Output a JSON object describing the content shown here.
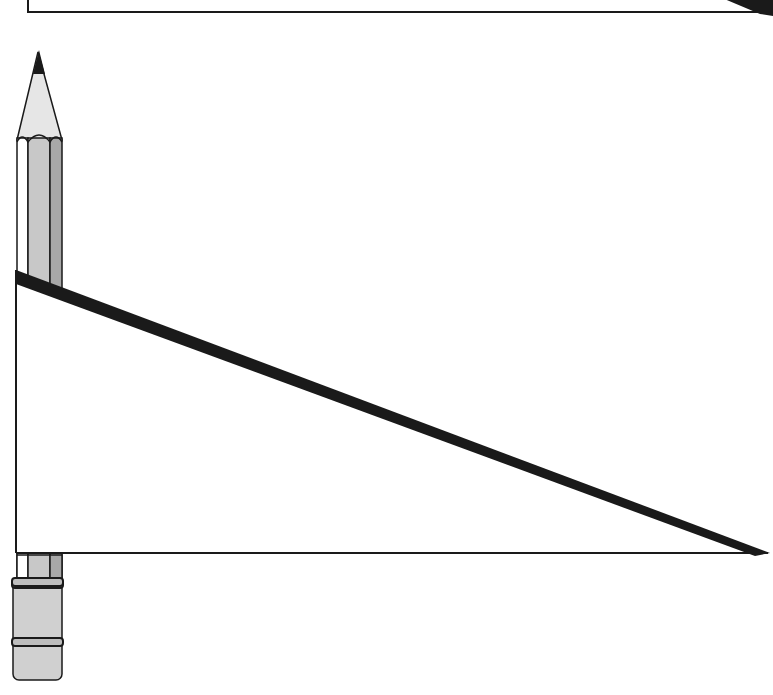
{
  "figure": {
    "colors": {
      "background": "#ffffff",
      "outline": "#1a1a1a",
      "pencil_body_light": "#ffffff",
      "pencil_body_mid": "#c8c8c8",
      "pencil_body_dark": "#a8a8a8",
      "pencil_tip_wood": "#e6e6e6",
      "pencil_lead": "#1a1a1a",
      "eraser_band": "#bdbdbd",
      "eraser": "#d0d0d0"
    },
    "top_triangle": {
      "visible": "partial"
    },
    "main_triangle": {
      "left_x": 16,
      "top_y": 274,
      "base_y": 553,
      "right_x": 768
    },
    "pencil": {
      "x_left": 17,
      "x_right": 62,
      "tip_y": 50,
      "bottom_y": 680
    }
  }
}
